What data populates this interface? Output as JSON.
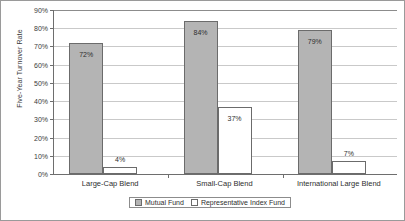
{
  "chart_data": {
    "type": "bar",
    "title": "",
    "xlabel": "",
    "ylabel": "Five-Year Turnover Rate",
    "categories": [
      "Large-Cap Blend",
      "Small-Cap Blend",
      "International Large Blend"
    ],
    "series": [
      {
        "name": "Mutual Fund",
        "values": [
          72,
          84,
          79
        ],
        "color": "#b4b4b4"
      },
      {
        "name": "Representative Index Fund",
        "values": [
          4,
          37,
          7
        ],
        "color": "#ffffff"
      }
    ],
    "value_labels": [
      [
        "72%",
        "4%"
      ],
      [
        "84%",
        "37%"
      ],
      [
        "79%",
        "7%"
      ]
    ],
    "ylim": [
      0,
      90
    ],
    "ytick_labels": [
      "90%",
      "80%",
      "70%",
      "60%",
      "50%",
      "40%",
      "30%",
      "20%",
      "10%",
      "0%"
    ],
    "ytick_values": [
      90,
      80,
      70,
      60,
      50,
      40,
      30,
      20,
      10,
      0
    ],
    "grid": "horizontal",
    "legend_position": "bottom"
  }
}
